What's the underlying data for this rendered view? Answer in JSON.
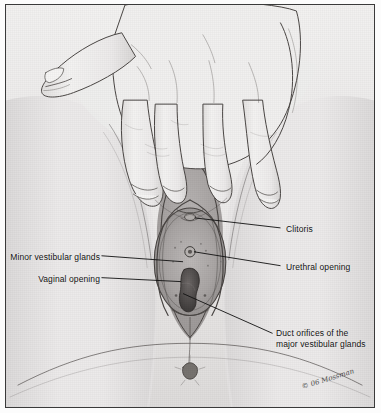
{
  "figure": {
    "kind": "anatomical-illustration",
    "medium": "pencil-and-wash drawing",
    "frame": {
      "border_color": "#3a3a3a",
      "paper_color": "#eae8e8"
    },
    "label_color": "#111111",
    "leader_color": "#111111"
  },
  "labels": {
    "clitoris": "Clitoris",
    "urethral_opening": "Urethral opening",
    "minor_vestibular_glands": "Minor vestibular glands",
    "vaginal_opening": "Vaginal opening",
    "duct_orifices_line1": "Duct orifices of the",
    "duct_orifices_line2": "major vestibular glands"
  },
  "credit": {
    "signature": "© 06 Mossman"
  }
}
